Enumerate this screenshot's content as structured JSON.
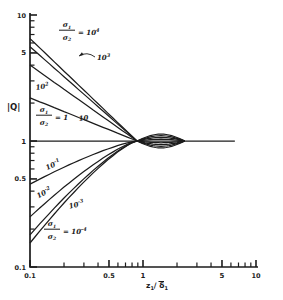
{
  "figure": {
    "background": "#ffffff",
    "ink": "#1c1c1c"
  },
  "chart_data": {
    "type": "line",
    "scale": "log-log",
    "title": "",
    "ylabel": "|Q|",
    "xlabel_parts": {
      "var": "z",
      "var_sub": "1",
      "slash": "/",
      "denom": "δ",
      "denom_overline": true,
      "denom_sub": "1"
    },
    "xlim": [
      0.1,
      10
    ],
    "ylim": [
      0.1,
      10
    ],
    "grid": false,
    "legend": "none",
    "x_ticks": {
      "major": [
        {
          "v": 0.1,
          "label": "0.1"
        },
        {
          "v": 0.5,
          "label": "0.5"
        },
        {
          "v": 1,
          "label": "1"
        },
        {
          "v": 5,
          "label": "5"
        },
        {
          "v": 10,
          "label": "10"
        }
      ],
      "minor": [
        0.2,
        0.3,
        0.4,
        0.6,
        0.7,
        0.8,
        0.9,
        2,
        3,
        4,
        6,
        7,
        8,
        9
      ]
    },
    "y_ticks": {
      "major": [
        {
          "v": 10,
          "label": "10"
        },
        {
          "v": 5,
          "label": "5"
        },
        {
          "v": 1,
          "label": "1"
        },
        {
          "v": 0.5,
          "label": "0.5"
        },
        {
          "v": 0.1,
          "label": "0.1"
        }
      ],
      "minor": [
        0.2,
        0.3,
        0.4,
        0.6,
        0.7,
        0.8,
        0.9,
        2,
        3,
        4,
        6,
        7,
        8,
        9
      ]
    },
    "ratio_label": {
      "num": "σ",
      "num_sub": "1",
      "den": "σ",
      "den_sub": "2",
      "eq": "="
    },
    "pinch_z": 0.885,
    "lens_end_z": 2.35,
    "curve_end_z": 6.5,
    "pre_pinch_exponent_upper": 1.0,
    "pre_pinch_exponent_lower": 1.3,
    "series": [
      {
        "ratio": "10^4",
        "ratio_value": 10000,
        "q0": 6.5,
        "lens_amp": -0.055,
        "label_style": "fraction",
        "label_pos": [
          67,
          27
        ]
      },
      {
        "ratio": "10^3",
        "ratio_value": 1000,
        "q0": 5.6,
        "lens_amp": -0.042,
        "label_style": "plain",
        "label_pos": [
          97,
          60
        ],
        "arrow": {
          "from": [
            95,
            57
          ],
          "to": [
            79,
            56
          ]
        }
      },
      {
        "ratio": "10^2",
        "ratio_value": 100,
        "q0": 4.0,
        "lens_amp": -0.028,
        "label_style": "plain",
        "label_pos": [
          36,
          90
        ],
        "label_rotate": -8
      },
      {
        "ratio": "10",
        "ratio_value": 10,
        "q0": 2.2,
        "lens_amp": -0.014,
        "label_style": "plain",
        "label_pos": [
          79,
          121
        ],
        "label_rotate": -6
      },
      {
        "ratio": "1",
        "ratio_value": 1,
        "q0": 1.0,
        "lens_amp": 0,
        "label_style": "fraction",
        "label_pos": [
          44,
          112
        ]
      },
      {
        "ratio": "10^-1",
        "ratio_value": 0.1,
        "q0": 0.455,
        "lens_amp": 0.014,
        "label_style": "plain",
        "label_pos": [
          54,
          167
        ],
        "label_rotate": -25,
        "label_anchor": "middle"
      },
      {
        "ratio": "10^-2",
        "ratio_value": 0.01,
        "q0": 0.25,
        "lens_amp": 0.028,
        "label_style": "plain",
        "label_pos": [
          45,
          195
        ],
        "label_rotate": -28,
        "label_anchor": "middle"
      },
      {
        "ratio": "10^-3",
        "ratio_value": 0.001,
        "q0": 0.18,
        "lens_amp": 0.042,
        "label_style": "plain",
        "label_pos": [
          77,
          207
        ],
        "label_rotate": -14,
        "label_anchor": "middle"
      },
      {
        "ratio": "10^-4",
        "ratio_value": 0.0001,
        "q0": 0.155,
        "lens_amp": 0.055,
        "label_style": "fraction",
        "label_pos": [
          52,
          226
        ]
      }
    ]
  }
}
